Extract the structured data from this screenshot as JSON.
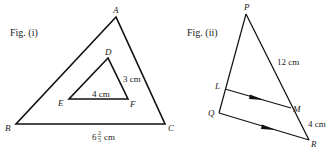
{
  "figures": [
    {
      "caption": "Fig. (i)",
      "outer_triangle": {
        "vertices": {
          "A": [
            116,
            17
          ],
          "B": [
            16,
            124
          ],
          "C": [
            165,
            124
          ]
        },
        "labels": {
          "A": "A",
          "B": "B",
          "C": "C"
        },
        "side_BC": {
          "whole": "6",
          "num": "2",
          "den": "5",
          "unit": "cm"
        }
      },
      "inner_triangle": {
        "vertices": {
          "D": [
            108,
            58
          ],
          "E": [
            69,
            99
          ],
          "F": [
            128,
            99
          ]
        },
        "labels": {
          "D": "D",
          "E": "E",
          "F": "F"
        },
        "side_EF": "4 cm",
        "side_DF": "3 cm"
      }
    },
    {
      "caption": "Fig. (ii)",
      "points": {
        "P": [
          246,
          14
        ],
        "L": [
          225,
          89
        ],
        "M": [
          291,
          108
        ],
        "Q": [
          219,
          113
        ],
        "R": [
          309,
          140
        ]
      },
      "labels": {
        "P": "P",
        "L": "L",
        "M": "M",
        "Q": "Q",
        "R": "R"
      },
      "side_PM": "12 cm",
      "side_MR": "4 cm",
      "parallel": "LM ∥ QR"
    }
  ]
}
